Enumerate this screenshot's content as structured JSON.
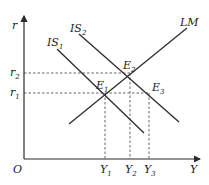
{
  "diagram": {
    "type": "IS-LM model",
    "axes": {
      "y_label": "r",
      "x_label": "Y",
      "origin_label": "O"
    },
    "curves": [
      {
        "name": "IS1",
        "label_main": "IS",
        "label_sub": "1"
      },
      {
        "name": "IS2",
        "label_main": "IS",
        "label_sub": "2"
      },
      {
        "name": "LM",
        "label_main": "LM",
        "label_sub": ""
      }
    ],
    "equilibria": [
      {
        "name": "E1",
        "label_main": "E",
        "label_sub": "1"
      },
      {
        "name": "E2",
        "label_main": "E",
        "label_sub": "2"
      },
      {
        "name": "E3",
        "label_main": "E",
        "label_sub": "3"
      }
    ],
    "y_ticks": [
      {
        "label_main": "r",
        "label_sub": "2"
      },
      {
        "label_main": "r",
        "label_sub": "1"
      }
    ],
    "x_ticks": [
      {
        "label_main": "Y",
        "label_sub": "1"
      },
      {
        "label_main": "Y",
        "label_sub": "2"
      },
      {
        "label_main": "Y",
        "label_sub": "3"
      }
    ],
    "colors": {
      "line": "#2b2b2b",
      "dashed": "#555555",
      "background": "#ffffff"
    }
  }
}
